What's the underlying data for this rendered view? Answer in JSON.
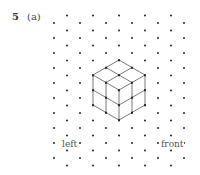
{
  "question": {
    "number": "5",
    "part": "(a)"
  },
  "grid": {
    "type": "isometric-dot-grid",
    "origin_x": 54,
    "col_spacing": 13,
    "row_spacing": 15,
    "columns": 11,
    "dot_color": "#222222"
  },
  "figure": {
    "line_color": "#555555"
  },
  "labels": {
    "left": "left",
    "front": "front"
  }
}
